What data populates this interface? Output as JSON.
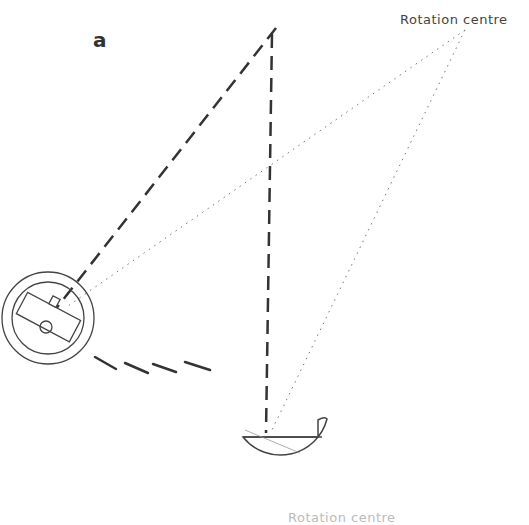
{
  "diagram": {
    "panel_label": "a",
    "labels": {
      "top_right": "Rotation centre",
      "bottom_truncated": "Rotation centre"
    },
    "elements": [
      {
        "name": "rotation-centre-top",
        "x": 465,
        "y": 30
      },
      {
        "name": "apex-point",
        "x": 274,
        "y": 30
      },
      {
        "name": "left-circular-device",
        "cx": 48,
        "cy": 318,
        "r_outer": 46,
        "r_inner": 36
      },
      {
        "name": "semicircular-device",
        "cx": 290,
        "cy": 433,
        "r": 48
      },
      {
        "name": "motion-strokes",
        "count": 4
      }
    ]
  }
}
